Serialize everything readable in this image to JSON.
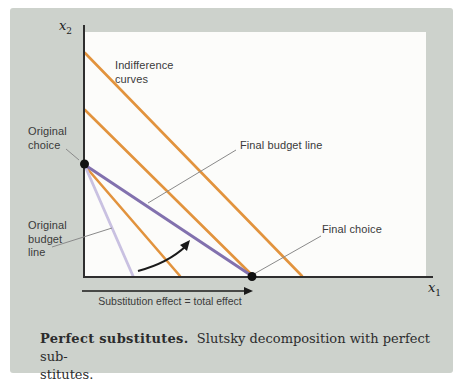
{
  "figure": {
    "type": "economics-diagram",
    "axes": {
      "y_label": "x",
      "y_sub": "2",
      "x_label": "x",
      "x_sub": "1"
    },
    "labels": {
      "indifference_line1": "Indifference",
      "indifference_line2": "curves",
      "original_choice_line1": "Original",
      "original_choice_line2": "choice",
      "final_budget": "Final budget line",
      "original_budget_line1": "Original",
      "original_budget_line2": "budget",
      "original_budget_line3": "line",
      "final_choice": "Final choice",
      "substitution_note": "Substitution effect = total effect"
    },
    "caption": {
      "bold": "Perfect substitutes.",
      "line1_rest": "Slutsky decomposition with perfect sub-",
      "line2": "stitutes."
    },
    "colors": {
      "panel_bg": "#cdd2cc",
      "plot_bg": "#fcfcfa",
      "indifference_orange": "#e2933d",
      "final_budget_purple": "#8271ae",
      "original_budget_lavender": "#c9c1e1",
      "axis_black": "#2e2e2e",
      "leader_gray": "#8a8a8a"
    }
  }
}
